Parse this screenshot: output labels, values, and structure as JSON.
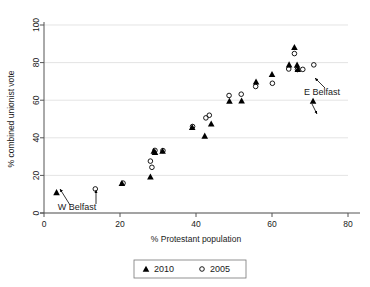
{
  "chart_data": {
    "type": "scatter",
    "title": "",
    "xlabel": "% Protestant population",
    "ylabel": "% combined unionist vote",
    "xlim": [
      0,
      80
    ],
    "ylim": [
      0,
      100
    ],
    "xticks": [
      0,
      20,
      40,
      60,
      80
    ],
    "yticks": [
      0,
      20,
      40,
      60,
      80,
      100
    ],
    "xtick_labels": [
      "0",
      "20",
      "40",
      "60",
      "80"
    ],
    "ytick_labels": [
      "0",
      "20",
      "40",
      "60",
      "80",
      "100"
    ],
    "grid": "horizontal",
    "legend_position": "bottom-center",
    "series": [
      {
        "name": "2010",
        "marker": "filled-triangle",
        "color": "#000000",
        "points": [
          {
            "x": 3.3,
            "y": 11.0
          },
          {
            "x": 20.5,
            "y": 15.8
          },
          {
            "x": 28.0,
            "y": 19.3
          },
          {
            "x": 28.9,
            "y": 33.0
          },
          {
            "x": 29.2,
            "y": 32.4
          },
          {
            "x": 31.2,
            "y": 33.0
          },
          {
            "x": 39.0,
            "y": 45.6
          },
          {
            "x": 42.3,
            "y": 41.0
          },
          {
            "x": 44.0,
            "y": 47.5
          },
          {
            "x": 48.8,
            "y": 59.6
          },
          {
            "x": 52.0,
            "y": 59.7
          },
          {
            "x": 55.8,
            "y": 69.8
          },
          {
            "x": 60.0,
            "y": 73.8
          },
          {
            "x": 64.5,
            "y": 78.9
          },
          {
            "x": 65.9,
            "y": 88.2
          },
          {
            "x": 66.6,
            "y": 78.8
          },
          {
            "x": 66.8,
            "y": 76.5
          },
          {
            "x": 70.8,
            "y": 59.6
          }
        ]
      },
      {
        "name": "2005",
        "marker": "open-circle",
        "color": "#000000",
        "points": [
          {
            "x": 13.5,
            "y": 12.8
          },
          {
            "x": 20.8,
            "y": 15.9
          },
          {
            "x": 28.0,
            "y": 27.6
          },
          {
            "x": 28.4,
            "y": 24.3
          },
          {
            "x": 29.2,
            "y": 33.3
          },
          {
            "x": 31.3,
            "y": 33.2
          },
          {
            "x": 39.1,
            "y": 46.0
          },
          {
            "x": 42.6,
            "y": 50.6
          },
          {
            "x": 43.5,
            "y": 52.0
          },
          {
            "x": 48.7,
            "y": 62.5
          },
          {
            "x": 51.9,
            "y": 63.2
          },
          {
            "x": 55.7,
            "y": 67.3
          },
          {
            "x": 60.1,
            "y": 69.0
          },
          {
            "x": 64.4,
            "y": 76.6
          },
          {
            "x": 65.9,
            "y": 84.8
          },
          {
            "x": 66.7,
            "y": 76.3
          },
          {
            "x": 68.1,
            "y": 76.4
          },
          {
            "x": 71.0,
            "y": 78.8
          }
        ]
      }
    ],
    "annotations": [
      {
        "label": "W Belfast",
        "text_x": 77,
        "text_y": 210,
        "arrows": [
          {
            "x1": 70,
            "y1": 205,
            "x2": 60,
            "y2": 189
          },
          {
            "x1": 96,
            "y1": 204,
            "x2": 96,
            "y2": 190
          }
        ]
      },
      {
        "label": "E Belfast",
        "text_x": 322,
        "text_y": 95,
        "arrows": [
          {
            "x1": 325,
            "y1": 88,
            "x2": 315,
            "y2": 78
          },
          {
            "x1": 312,
            "y1": 104,
            "x2": 317,
            "y2": 114
          }
        ]
      }
    ],
    "legend": [
      {
        "label": "2010",
        "marker": "filled-triangle"
      },
      {
        "label": "2005",
        "marker": "open-circle"
      }
    ]
  }
}
